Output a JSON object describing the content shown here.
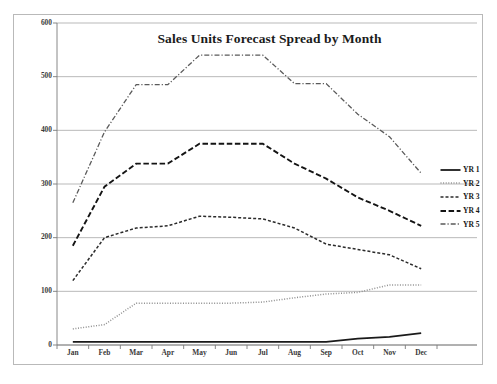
{
  "chart_data": {
    "type": "line",
    "title": "Sales Units Forecast Spread by Month",
    "xlabel": "",
    "ylabel": "",
    "categories": [
      "Jan",
      "Feb",
      "Mar",
      "Apr",
      "May",
      "Jun",
      "Jul",
      "Aug",
      "Sep",
      "Oct",
      "Nov",
      "Dec"
    ],
    "ylim": [
      0,
      600
    ],
    "yticks": [
      0,
      100,
      200,
      300,
      400,
      500,
      600
    ],
    "ytick_labels": [
      "0",
      "100",
      "200",
      "300",
      "400",
      "500",
      "600"
    ],
    "grid": true,
    "grid_axis": "y",
    "legend_position": "right",
    "series": [
      {
        "name": "YR 1",
        "style": "solid",
        "color": "#1a1a1a",
        "values": [
          6,
          6,
          6,
          6,
          6,
          6,
          6,
          6,
          6,
          12,
          15,
          22
        ]
      },
      {
        "name": "YR 2",
        "style": "dotted",
        "color": "#8f8f8f",
        "values": [
          30,
          38,
          78,
          78,
          78,
          78,
          80,
          88,
          95,
          98,
          112,
          112
        ]
      },
      {
        "name": "YR 3",
        "style": "dashed-small",
        "color": "#2b2b2b",
        "values": [
          120,
          200,
          218,
          222,
          240,
          238,
          235,
          218,
          188,
          178,
          168,
          142
        ]
      },
      {
        "name": "YR 4",
        "style": "dashed-medium",
        "color": "#141414",
        "values": [
          185,
          295,
          338,
          338,
          375,
          375,
          375,
          338,
          310,
          275,
          250,
          222
        ]
      },
      {
        "name": "YR 5",
        "style": "dash-dot",
        "color": "#5a5a5a",
        "values": [
          265,
          397,
          485,
          485,
          540,
          540,
          540,
          487,
          487,
          430,
          388,
          320
        ]
      }
    ]
  },
  "legend": {
    "items": [
      {
        "label": "YR 1"
      },
      {
        "label": "YR 2"
      },
      {
        "label": "YR 3"
      },
      {
        "label": "YR 4"
      },
      {
        "label": "YR 5"
      }
    ]
  },
  "colors": {
    "frame": "#b9b9b9",
    "grid": "#9c9c9c",
    "axis": "#7a7a7a",
    "text": "#1b1b1b",
    "background": "#ffffff"
  }
}
